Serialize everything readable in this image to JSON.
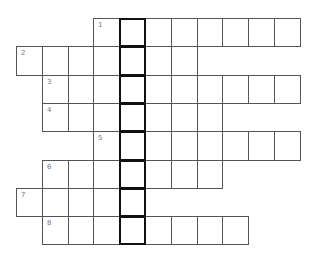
{
  "puzzle": {
    "type": "crossword",
    "highlight_column": 4,
    "grid_origin": {
      "x": 16,
      "y": 18
    },
    "cell_width": 25.8,
    "cell_height": 28.3,
    "colors": {
      "border": "#555555",
      "highlight_border": "#111111",
      "number": "#777777",
      "background": "#ffffff"
    },
    "rows": [
      {
        "number": "1",
        "start_col": 3,
        "end_col": 10
      },
      {
        "number": "2",
        "start_col": 0,
        "end_col": 6
      },
      {
        "number": "3",
        "start_col": 1,
        "end_col": 10
      },
      {
        "number": "4",
        "start_col": 1,
        "end_col": 7
      },
      {
        "number": "5",
        "start_col": 3,
        "end_col": 10
      },
      {
        "number": "6",
        "start_col": 1,
        "end_col": 7
      },
      {
        "number": "7",
        "start_col": 0,
        "end_col": 4
      },
      {
        "number": "8",
        "start_col": 1,
        "end_col": 8
      }
    ]
  }
}
